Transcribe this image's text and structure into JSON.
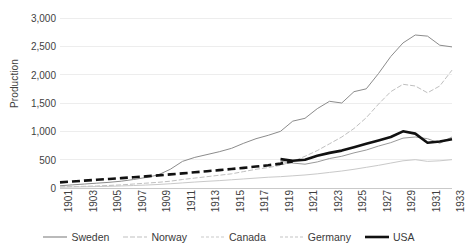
{
  "chart_data": {
    "type": "line",
    "title": "",
    "xlabel": "",
    "ylabel": "Production",
    "xlim": [
      1901,
      1933
    ],
    "ylim": [
      0,
      3000
    ],
    "grid": true,
    "legend_position": "bottom",
    "x": [
      1901,
      1902,
      1903,
      1904,
      1905,
      1906,
      1907,
      1908,
      1909,
      1910,
      1911,
      1912,
      1913,
      1914,
      1915,
      1916,
      1917,
      1918,
      1919,
      1920,
      1921,
      1922,
      1923,
      1924,
      1925,
      1926,
      1927,
      1928,
      1929,
      1930,
      1931,
      1932,
      1933
    ],
    "x_tick_labels": [
      "1901",
      "1903",
      "1905",
      "1907",
      "1909",
      "1911",
      "1913",
      "1915",
      "1917",
      "1919",
      "1921",
      "1923",
      "1925",
      "1927",
      "1929",
      "1931",
      "1933"
    ],
    "y_tick_labels": [
      "0",
      "500",
      "1,000",
      "1,500",
      "2,000",
      "2,500",
      "3,000"
    ],
    "y_ticks": [
      0,
      500,
      1000,
      1500,
      2000,
      2500,
      3000
    ],
    "series": [
      {
        "name": "Sweden",
        "color": "#8c8c8c",
        "style": "solid",
        "width": 1,
        "values": [
          40,
          55,
          70,
          85,
          100,
          120,
          150,
          185,
          230,
          330,
          470,
          540,
          590,
          640,
          700,
          790,
          870,
          930,
          1000,
          1180,
          1230,
          1400,
          1530,
          1500,
          1700,
          1750,
          2020,
          2320,
          2560,
          2700,
          2680,
          2520,
          2490
        ]
      },
      {
        "name": "Norway",
        "color": "#bfbfbf",
        "style": "dashed-fine",
        "width": 1,
        "values": [
          20,
          25,
          30,
          35,
          45,
          55,
          70,
          85,
          100,
          120,
          150,
          175,
          200,
          225,
          250,
          290,
          330,
          360,
          400,
          470,
          560,
          660,
          780,
          900,
          1050,
          1240,
          1480,
          1700,
          1830,
          1800,
          1680,
          1800,
          2080
        ]
      },
      {
        "name": "Canada",
        "color": "#c9c9c9",
        "style": "solid",
        "width": 1,
        "values": [
          15,
          18,
          22,
          26,
          30,
          36,
          44,
          52,
          62,
          75,
          90,
          105,
          118,
          130,
          145,
          160,
          175,
          190,
          200,
          215,
          230,
          250,
          275,
          300,
          330,
          365,
          400,
          440,
          480,
          500,
          470,
          480,
          500
        ]
      },
      {
        "name": "Germany",
        "color": "#9a9a9a",
        "style": "solid-grey",
        "width": 1,
        "values": [
          null,
          null,
          null,
          null,
          null,
          null,
          null,
          null,
          null,
          null,
          null,
          null,
          null,
          null,
          null,
          null,
          null,
          null,
          470,
          440,
          420,
          460,
          520,
          560,
          620,
          670,
          740,
          800,
          880,
          900,
          870,
          790,
          900
        ]
      },
      {
        "name": "USA",
        "color": "#111111",
        "style": "thick-solid",
        "width": 2.6,
        "values": [
          null,
          null,
          null,
          null,
          null,
          null,
          null,
          null,
          null,
          null,
          null,
          null,
          null,
          null,
          null,
          null,
          null,
          null,
          510,
          480,
          500,
          570,
          620,
          660,
          720,
          780,
          840,
          900,
          1000,
          960,
          800,
          820,
          860
        ]
      },
      {
        "name": "Germany-early",
        "color": "#111111",
        "style": "thick-dashed",
        "width": 2.6,
        "values": [
          100,
          115,
          130,
          145,
          160,
          175,
          190,
          205,
          222,
          240,
          258,
          277,
          296,
          315,
          335,
          355,
          378,
          400,
          430,
          470,
          null,
          null,
          null,
          null,
          null,
          null,
          null,
          null,
          null,
          null,
          null,
          null,
          null
        ]
      }
    ]
  },
  "legend": {
    "items": [
      {
        "label": "Sweden",
        "swatch": "solid-grey-line",
        "color": "#8c8c8c"
      },
      {
        "label": "Norway",
        "swatch": "dashed-light-line",
        "color": "#bfbfbf"
      },
      {
        "label": "Canada",
        "swatch": "dotted-light-line",
        "color": "#c9c9c9"
      },
      {
        "label": "Germany",
        "swatch": "dotted-light-line",
        "color": "#c4c4c4"
      },
      {
        "label": "USA",
        "swatch": "thick-black-line",
        "color": "#111111"
      }
    ]
  }
}
